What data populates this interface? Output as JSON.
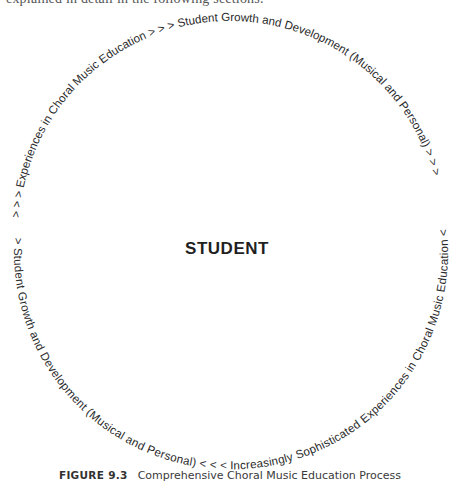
{
  "page": {
    "cropped_top_text": "explained in detail in the following sections."
  },
  "diagram": {
    "center_label": "STUDENT",
    "outer_arc_text": "> > > Experiences in Choral Music Education > > > Student Growth and Development (Musical and Personal) > > >",
    "inner_arc_text": "> Student Growth and Development (Musical and Personal) < < < Increasingly Sophisticated Experiences in Choral Music Education <",
    "text_color": "#2a2a2a"
  },
  "caption": {
    "figure_number": "FIGURE 9.3",
    "title": "Comprehensive Choral Music Education Process"
  }
}
